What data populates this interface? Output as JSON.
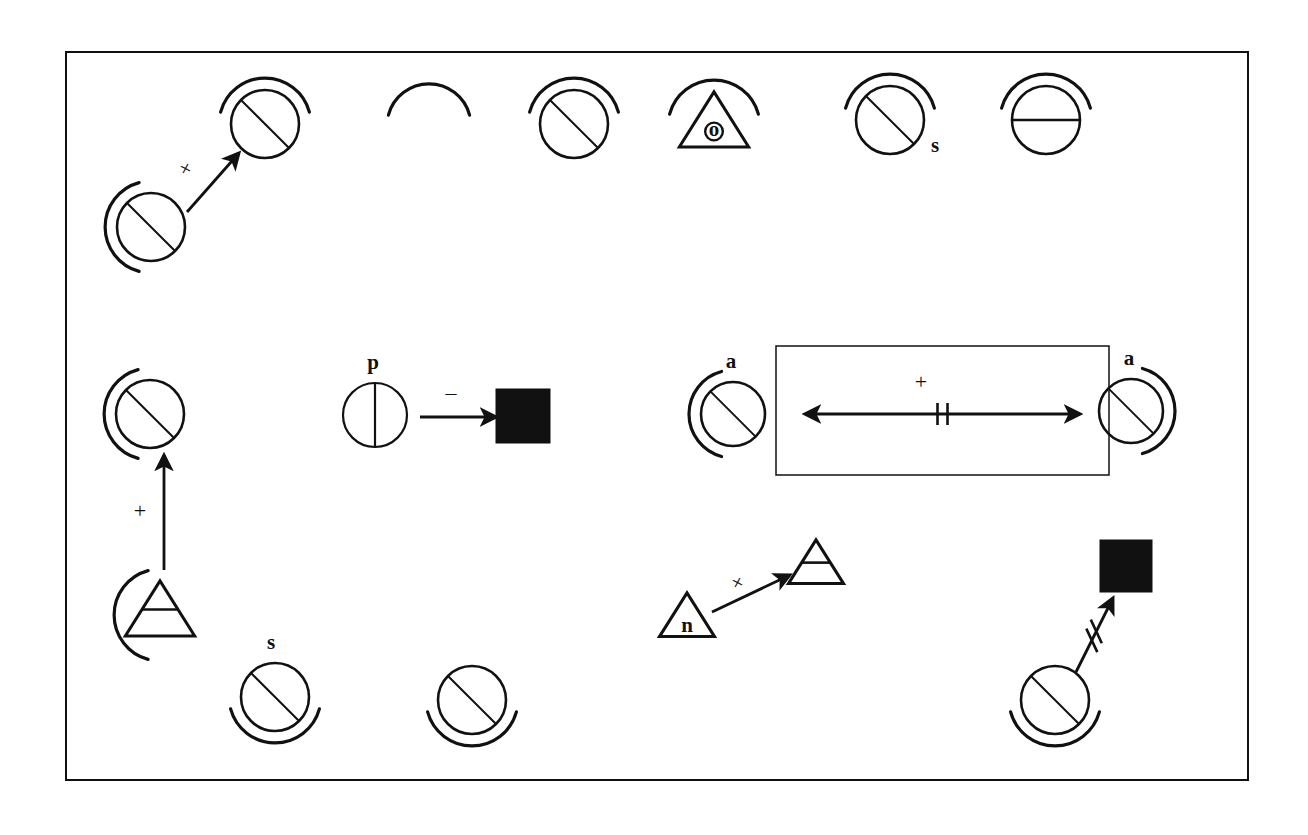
{
  "figure": {
    "kind": "hand-drawn symbol diagram",
    "background_color": "#ffffff",
    "ink_color": "#111111",
    "frame": {
      "name": "outer-frame",
      "x": 66,
      "y": 52,
      "width": 1182,
      "height": 728,
      "stroke_width": 2
    },
    "inner_box": {
      "name": "inner-rectangle",
      "x": 776,
      "y": 346,
      "width": 333,
      "height": 129,
      "stroke_width": 1.5
    }
  },
  "labels": {
    "triangle_o": "o",
    "circle_s_top": "s",
    "circle_p": "p",
    "circle_a_left": "a",
    "circle_a_right": "a",
    "triangle_n": "n",
    "circle_s_bottom": "s",
    "plus_top_left": "+",
    "plus_vertical": "+",
    "minus_center": "–",
    "plus_inner_box": "+",
    "plus_triangle": "+"
  },
  "nodes": [
    {
      "id": "n1",
      "name": "circle-diagonal-arc-top",
      "shape": "circle-diagonal",
      "arc": "top",
      "cx": 265,
      "cy": 124,
      "r": 34,
      "label": ""
    },
    {
      "id": "n2",
      "name": "lone-arc",
      "shape": "arc-only",
      "arc": "top",
      "cx": 429,
      "cy": 126,
      "r": 34,
      "label": ""
    },
    {
      "id": "n3",
      "name": "circle-diagonal-arc-top-2",
      "shape": "circle-diagonal",
      "arc": "top",
      "cx": 574,
      "cy": 124,
      "r": 34,
      "label": ""
    },
    {
      "id": "n4",
      "name": "triangle-o-arc",
      "shape": "triangle-dot",
      "arc": "top",
      "cx": 714,
      "cy": 126,
      "r": 34,
      "label": "o"
    },
    {
      "id": "n5",
      "name": "circle-diagonal-arc-top-s",
      "shape": "circle-diagonal",
      "arc": "top",
      "cx": 890,
      "cy": 120,
      "r": 34,
      "label": "s"
    },
    {
      "id": "n6",
      "name": "circle-horizontal-arc-top",
      "shape": "circle-horizontal",
      "arc": "top",
      "cx": 1046,
      "cy": 120,
      "r": 34,
      "label": ""
    },
    {
      "id": "n7",
      "name": "circle-diagonal-arc-left",
      "shape": "circle-diagonal",
      "arc": "left",
      "cx": 151,
      "cy": 227,
      "r": 34,
      "label": ""
    },
    {
      "id": "n8",
      "name": "circle-diagonal-arc-left-mid",
      "shape": "circle-diagonal",
      "arc": "left",
      "cx": 150,
      "cy": 414,
      "r": 34,
      "label": ""
    },
    {
      "id": "n9",
      "name": "circle-vertical-p",
      "shape": "circle-vertical",
      "arc": "none",
      "cx": 375,
      "cy": 415,
      "r": 32,
      "label": "p"
    },
    {
      "id": "n10",
      "name": "filled-square-center",
      "shape": "square-filled",
      "arc": "none",
      "cx": 523,
      "cy": 416,
      "r": 27,
      "label": ""
    },
    {
      "id": "n11",
      "name": "circle-diagonal-arc-left-a",
      "shape": "circle-diagonal",
      "arc": "left",
      "cx": 733,
      "cy": 414,
      "r": 32,
      "label": "a"
    },
    {
      "id": "n12",
      "name": "circle-diagonal-arc-right-a",
      "shape": "circle-diagonal",
      "arc": "right",
      "cx": 1131,
      "cy": 411,
      "r": 32,
      "label": "a"
    },
    {
      "id": "n13",
      "name": "triangle-bar-arc-left",
      "shape": "triangle-bar",
      "arc": "left",
      "cx": 160,
      "cy": 615,
      "r": 34,
      "label": ""
    },
    {
      "id": "n14",
      "name": "circle-diagonal-arc-bottom-s",
      "shape": "circle-diagonal",
      "arc": "bottom",
      "cx": 275,
      "cy": 697,
      "r": 34,
      "label": "s"
    },
    {
      "id": "n15",
      "name": "circle-diagonal-arc-bottom",
      "shape": "circle-diagonal",
      "arc": "bottom",
      "cx": 472,
      "cy": 700,
      "r": 34,
      "label": ""
    },
    {
      "id": "n16",
      "name": "triangle-n",
      "shape": "triangle-plain",
      "arc": "none",
      "cx": 687,
      "cy": 620,
      "r": 27,
      "label": "n"
    },
    {
      "id": "n17",
      "name": "triangle-bar-target",
      "shape": "triangle-bar",
      "arc": "none",
      "cx": 816,
      "cy": 567,
      "r": 27,
      "label": ""
    },
    {
      "id": "n18",
      "name": "filled-square-bottom-right",
      "shape": "square-filled",
      "arc": "none",
      "cx": 1126,
      "cy": 566,
      "r": 26,
      "label": ""
    },
    {
      "id": "n19",
      "name": "circle-diagonal-arc-bottom-br",
      "shape": "circle-diagonal",
      "arc": "bottom",
      "cx": 1055,
      "cy": 700,
      "r": 34,
      "label": ""
    }
  ],
  "edges": [
    {
      "id": "e1",
      "name": "arrow-plus-diagonal-top-left",
      "from": "n7",
      "to": "n1",
      "x1": 187,
      "y1": 212,
      "x2": 239,
      "y2": 153,
      "style": "solid",
      "head": "end",
      "marker": "none",
      "label": "+",
      "label_rotated": true,
      "lx": 192,
      "ly": 172
    },
    {
      "id": "e2",
      "name": "arrow-plus-vertical-left",
      "from": "n13",
      "to": "n8",
      "x1": 164,
      "y1": 570,
      "x2": 164,
      "y2": 455,
      "style": "solid",
      "head": "end",
      "marker": "none",
      "label": "+",
      "label_rotated": false,
      "lx": 140,
      "ly": 518
    },
    {
      "id": "e3",
      "name": "arrow-minus-center",
      "from": "n9",
      "to": "n10",
      "x1": 420,
      "y1": 417,
      "x2": 496,
      "y2": 417,
      "style": "solid",
      "head": "end",
      "marker": "none",
      "label": "–",
      "label_rotated": false,
      "lx": 451,
      "ly": 400
    },
    {
      "id": "e4",
      "name": "double-arrow-plus-inner-box",
      "from": "n11",
      "to": "n12",
      "x1": 805,
      "y1": 414,
      "x2": 1080,
      "y2": 414,
      "style": "solid",
      "head": "both",
      "marker": "double-tick",
      "label": "+",
      "label_rotated": false,
      "lx": 921,
      "ly": 389
    },
    {
      "id": "e5",
      "name": "arrow-plus-triangle",
      "from": "n16",
      "to": "n17",
      "x1": 712,
      "y1": 612,
      "x2": 790,
      "y2": 575,
      "style": "solid",
      "head": "end",
      "marker": "none",
      "label": "+",
      "label_rotated": true,
      "lx": 744,
      "ly": 586
    },
    {
      "id": "e6",
      "name": "arrow-crossed-bottom-right",
      "from": "n19",
      "to": "n18",
      "x1": 1076,
      "y1": 672,
      "x2": 1113,
      "y2": 598,
      "style": "solid",
      "head": "end",
      "marker": "double-slash",
      "label": "",
      "label_rotated": false,
      "lx": 0,
      "ly": 0
    }
  ]
}
